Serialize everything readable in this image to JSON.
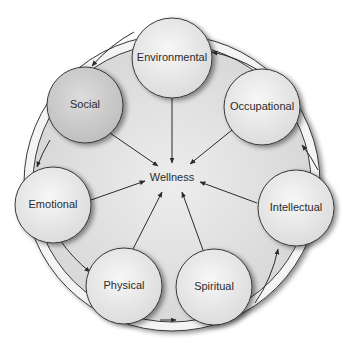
{
  "diagram": {
    "center": {
      "label": "Wellness"
    },
    "nodes": [
      {
        "id": "environmental",
        "label": "Environmental"
      },
      {
        "id": "occupational",
        "label": "Occupational"
      },
      {
        "id": "intellectual",
        "label": "Intellectual"
      },
      {
        "id": "spiritual",
        "label": "Spiritual"
      },
      {
        "id": "physical",
        "label": "Physical"
      },
      {
        "id": "emotional",
        "label": "Emotional"
      },
      {
        "id": "social",
        "label": "Social"
      }
    ],
    "colors": {
      "disc": "#dcdcdc",
      "ring": "#f2f2f2",
      "node_fill": "#ececec",
      "social_fill": "#cfcfcf",
      "stroke": "#3a3a3a"
    }
  }
}
